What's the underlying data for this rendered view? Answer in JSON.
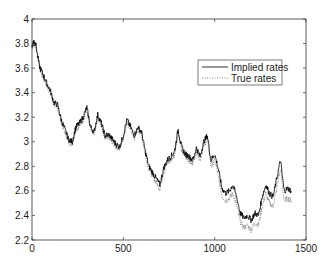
{
  "chart_data": {
    "type": "line",
    "title": "",
    "xlabel": "",
    "ylabel": "",
    "xlim": [
      0,
      1500
    ],
    "ylim": [
      2.2,
      4
    ],
    "xticks": [
      0,
      500,
      1000,
      1500
    ],
    "yticks": [
      2.2,
      2.4,
      2.6,
      2.8,
      3,
      3.2,
      3.4,
      3.6,
      3.8,
      4
    ],
    "xtick_labels": [
      "0",
      "500",
      "1000",
      "1500"
    ],
    "ytick_labels": [
      "2.2",
      "2.4",
      "2.6",
      "2.8",
      "3",
      "3.2",
      "3.4",
      "3.6",
      "3.8",
      "4"
    ],
    "grid": false,
    "legend": {
      "position": "upper right (inset)",
      "entries": [
        "Implied rates",
        "True rates"
      ]
    },
    "x": [
      0,
      10,
      20,
      40,
      60,
      80,
      100,
      120,
      140,
      160,
      180,
      200,
      220,
      240,
      260,
      280,
      300,
      320,
      340,
      360,
      380,
      400,
      420,
      440,
      460,
      480,
      500,
      520,
      540,
      560,
      580,
      600,
      620,
      640,
      660,
      680,
      700,
      720,
      740,
      760,
      780,
      800,
      820,
      840,
      860,
      880,
      900,
      920,
      940,
      960,
      980,
      1000,
      1020,
      1040,
      1060,
      1080,
      1100,
      1120,
      1140,
      1160,
      1180,
      1200,
      1220,
      1240,
      1260,
      1280,
      1300,
      1320,
      1340,
      1360,
      1380,
      1400,
      1420
    ],
    "series": [
      {
        "name": "Implied rates",
        "style": "solid",
        "color": "#000000",
        "values": [
          3.78,
          3.82,
          3.8,
          3.62,
          3.55,
          3.48,
          3.42,
          3.32,
          3.3,
          3.18,
          3.1,
          3.02,
          3.0,
          3.12,
          3.15,
          3.2,
          3.28,
          3.12,
          3.08,
          3.22,
          3.15,
          3.05,
          3.06,
          3.02,
          2.98,
          2.96,
          3.05,
          3.18,
          3.12,
          3.05,
          3.12,
          3.08,
          2.92,
          2.8,
          2.75,
          2.7,
          2.65,
          2.78,
          2.85,
          2.88,
          2.92,
          3.1,
          2.95,
          2.9,
          2.88,
          2.85,
          2.95,
          2.88,
          3.0,
          3.05,
          2.85,
          2.9,
          2.78,
          2.62,
          2.58,
          2.6,
          2.65,
          2.55,
          2.42,
          2.38,
          2.4,
          2.36,
          2.42,
          2.4,
          2.55,
          2.65,
          2.58,
          2.55,
          2.7,
          2.85,
          2.6,
          2.62,
          2.6
        ]
      },
      {
        "name": "True rates",
        "style": "dotted",
        "color": "#666666",
        "values": [
          3.77,
          3.8,
          3.79,
          3.6,
          3.53,
          3.46,
          3.4,
          3.3,
          3.28,
          3.16,
          3.08,
          3.0,
          2.98,
          3.1,
          3.13,
          3.18,
          3.26,
          3.1,
          3.06,
          3.2,
          3.13,
          3.03,
          3.04,
          3.0,
          2.96,
          2.94,
          3.03,
          3.16,
          3.1,
          3.03,
          3.1,
          3.06,
          2.9,
          2.78,
          2.72,
          2.67,
          2.62,
          2.75,
          2.82,
          2.85,
          2.89,
          3.07,
          2.92,
          2.87,
          2.85,
          2.82,
          2.92,
          2.85,
          2.97,
          3.02,
          2.8,
          2.85,
          2.72,
          2.56,
          2.52,
          2.54,
          2.58,
          2.48,
          2.35,
          2.3,
          2.32,
          2.28,
          2.34,
          2.32,
          2.47,
          2.58,
          2.5,
          2.47,
          2.62,
          2.78,
          2.52,
          2.54,
          2.52
        ]
      }
    ]
  },
  "legend": {
    "implied_label": "Implied rates",
    "true_label": "True rates"
  }
}
